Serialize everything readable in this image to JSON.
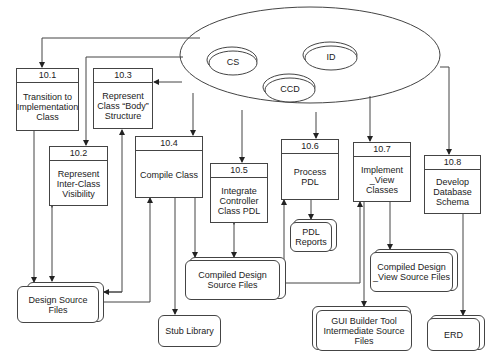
{
  "diagram": {
    "central_store": {
      "items": [
        {
          "id": "cs",
          "label": "CS"
        },
        {
          "id": "id",
          "label": "ID"
        },
        {
          "id": "ccd",
          "label": "CCD"
        }
      ]
    },
    "processes": [
      {
        "id": "p101",
        "number": "10.1",
        "title": "Transition to Implementation Class"
      },
      {
        "id": "p102",
        "number": "10.2",
        "title": "Represent Inter-Class Visibility"
      },
      {
        "id": "p103",
        "number": "10.3",
        "title": "Represent Class “Body” Structure"
      },
      {
        "id": "p104",
        "number": "10.4",
        "title": "Compile Class"
      },
      {
        "id": "p105",
        "number": "10.5",
        "title": "Integrate Controller Class PDL"
      },
      {
        "id": "p106",
        "number": "10.6",
        "title": "Process PDL"
      },
      {
        "id": "p107",
        "number": "10.7",
        "title": "Implement _View Classes"
      },
      {
        "id": "p108",
        "number": "10.8",
        "title": "Develop Database Schema"
      }
    ],
    "stores": [
      {
        "id": "design_src",
        "label": "Design Source Files"
      },
      {
        "id": "stub_lib",
        "label": "Stub Library"
      },
      {
        "id": "compiled_src",
        "label": "Compiled Design Source Files"
      },
      {
        "id": "pdl_reports",
        "label": "PDL Reports"
      },
      {
        "id": "compiled_view",
        "label": "Compiled Design _View Source Files"
      },
      {
        "id": "gui_builder",
        "label": "GUI Builder Tool Intermediate Source Files"
      },
      {
        "id": "erd",
        "label": "ERD"
      }
    ],
    "flows": [
      {
        "from": "central_store",
        "to": "10.1"
      },
      {
        "from": "central_store",
        "to": "10.2"
      },
      {
        "from": "central_store",
        "to": "10.3"
      },
      {
        "from": "central_store",
        "to": "10.4"
      },
      {
        "from": "central_store",
        "to": "10.5"
      },
      {
        "from": "central_store",
        "to": "10.6"
      },
      {
        "from": "central_store",
        "to": "10.7"
      },
      {
        "from": "central_store",
        "to": "10.8"
      },
      {
        "from": "10.1",
        "to": "Design Source Files"
      },
      {
        "from": "10.2",
        "to": "Design Source Files",
        "bidirectional": true
      },
      {
        "from": "Design Source Files",
        "to": "10.3",
        "bidirectional": true
      },
      {
        "from": "Design Source Files",
        "to": "10.4"
      },
      {
        "from": "10.4",
        "to": "Stub Library"
      },
      {
        "from": "10.4",
        "to": "Compiled Design Source Files"
      },
      {
        "from": "10.5",
        "to": "Compiled Design Source Files",
        "bidirectional": true
      },
      {
        "from": "Compiled Design Source Files",
        "to": "10.6"
      },
      {
        "from": "Compiled Design Source Files",
        "to": "10.7"
      },
      {
        "from": "10.6",
        "to": "PDL Reports"
      },
      {
        "from": "10.7",
        "to": "Compiled Design _View Source Files"
      },
      {
        "from": "10.7",
        "to": "GUI Builder Tool Intermediate Source Files"
      },
      {
        "from": "10.8",
        "to": "ERD"
      }
    ]
  }
}
